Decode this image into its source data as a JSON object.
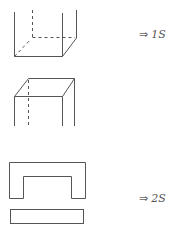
{
  "figure": {
    "type": "diagram",
    "stroke_color": "#555555",
    "background": "#ffffff",
    "items": [
      {
        "id": "open-box",
        "kind": "open-top box (3D wireframe)"
      },
      {
        "id": "closed-top-box",
        "kind": "box with top face (3D wireframe)"
      },
      {
        "id": "u-shape-net",
        "kind": "U-shaped unfolded net"
      },
      {
        "id": "strip",
        "kind": "rectangular strip"
      }
    ],
    "labels": [
      {
        "arrow": "⇒",
        "value": "1S"
      },
      {
        "arrow": "⇒",
        "value": "2S"
      }
    ]
  }
}
